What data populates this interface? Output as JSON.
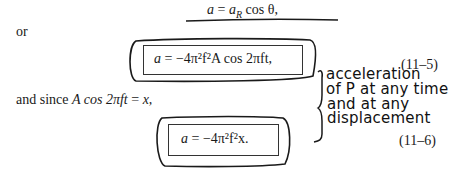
{
  "page": {
    "equation_top": "a = a_R cos θ,",
    "equation_top_parts": {
      "lhs": "a",
      "eq": "=",
      "rhs_var": "a",
      "rhs_sub": "R",
      "rhs_rest": "cos θ,"
    },
    "word_or": "or",
    "equation_11_5": {
      "text": "a = −4π²f²A cos 2πft,",
      "lhs": "a",
      "eq": "=",
      "rhs": "−4π²f²A cos 2πft,",
      "number": "(11–5)"
    },
    "connector_text": "and since A cos 2πft = x,",
    "connector_parts": {
      "prefix": "and since",
      "math": "A cos 2πft",
      "eq": "=",
      "rhs": "x,"
    },
    "equation_11_6": {
      "text": "a = −4π²f²x.",
      "lhs": "a",
      "eq": "=",
      "rhs": "−4π²f²x.",
      "number": "(11–6)"
    },
    "handwritten_note": {
      "lines": [
        "acceleration",
        "of P at any time",
        "and at any",
        "displacement"
      ]
    }
  }
}
